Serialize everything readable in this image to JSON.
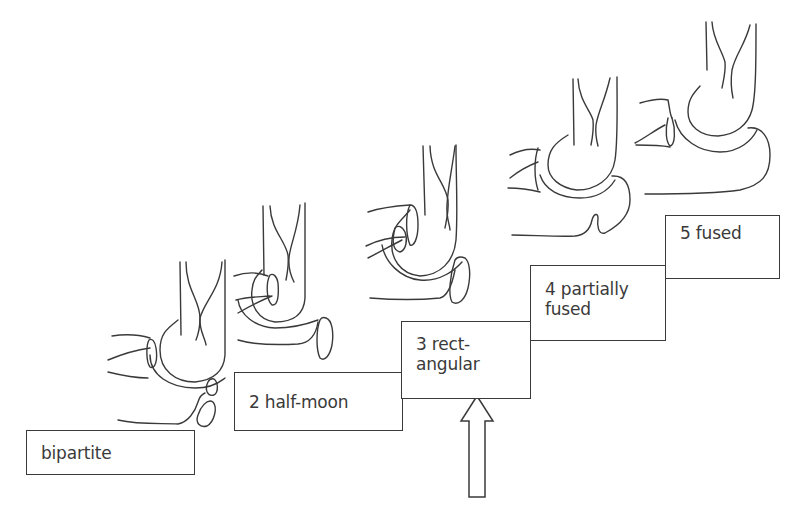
{
  "figure": {
    "stages": [
      {
        "id": "bipartite",
        "label": "bipartite"
      },
      {
        "id": "half-moon",
        "label": "2 half-moon"
      },
      {
        "id": "rectangular",
        "label": "3 rect-\nangular"
      },
      {
        "id": "partially-fused",
        "label": "4 partially\nfused"
      },
      {
        "id": "fused",
        "label": "5 fused"
      }
    ],
    "arrow": {
      "points_to": "rectangular",
      "direction": "up"
    },
    "line_color": "#3a3a3a",
    "background": "#ffffff"
  }
}
